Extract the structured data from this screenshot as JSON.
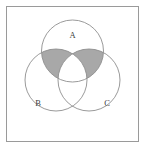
{
  "figure": {
    "type": "venn-diagram",
    "frame": {
      "x": 6,
      "y": 6,
      "width": 133,
      "height": 136,
      "border_color": "#9a9a9a",
      "background_color": "#ffffff"
    },
    "geometry": {
      "radius": 31,
      "circle_stroke_color": "#8e8e8e",
      "shade_color": "#a8a8a8"
    },
    "sets": [
      {
        "id": "A",
        "label": "A",
        "cx": 72.5,
        "cy": 51,
        "label_x": 72.5,
        "label_y": 36
      },
      {
        "id": "B",
        "label": "B",
        "cx": 56,
        "cy": 80,
        "label_x": 38,
        "label_y": 104
      },
      {
        "id": "C",
        "label": "C",
        "cx": 89,
        "cy": 80,
        "label_x": 107,
        "label_y": 104
      }
    ],
    "shaded_regions": [
      {
        "id": "A-and-B-only",
        "description": "Intersection of A and B excluding C",
        "color": "#a8a8a8"
      },
      {
        "id": "A-and-C-only",
        "description": "Intersection of A and C excluding B",
        "color": "#a8a8a8"
      }
    ],
    "unshaded_regions": [
      "A only",
      "B only",
      "C only",
      "B and C only",
      "A and B and C",
      "outside all sets"
    ]
  }
}
